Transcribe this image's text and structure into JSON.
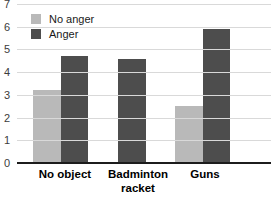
{
  "chart_data": {
    "type": "bar",
    "title": "",
    "xlabel": "",
    "ylabel": "",
    "categories": [
      "No object",
      "Badminton racket",
      "Guns"
    ],
    "series": [
      {
        "name": "No anger",
        "color": "#b9b9b9",
        "values": [
          3.2,
          null,
          2.5
        ]
      },
      {
        "name": "Anger",
        "color": "#4d4d4d",
        "values": [
          4.7,
          4.6,
          5.9
        ]
      }
    ],
    "ylim": [
      0,
      7
    ],
    "yticks": [
      0,
      1,
      2,
      3,
      4,
      5,
      6,
      7
    ],
    "grid": "horizontal",
    "legend_position": "top-left",
    "note_missing_bar": "No light bar is drawn for Badminton racket; its single dark bar is centered in the group"
  },
  "colors": {
    "background": "#ffffff",
    "gridline": "#d9d9d9",
    "axis": "#1c1c1c",
    "tick_text": "#3c3c3c",
    "legend_text": "#1a1a1a",
    "category_text": "#000000"
  }
}
